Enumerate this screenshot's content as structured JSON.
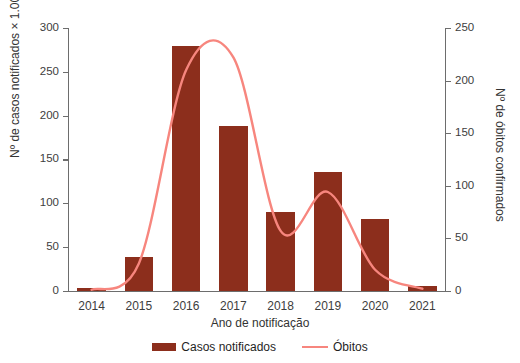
{
  "figure": {
    "cropped_title_fragment": "",
    "bar_color": "#8C2E1C",
    "line_color": "#F7867E",
    "axis_color": "#6D6D6D",
    "background": "#FFFFFF"
  },
  "chart_data": {
    "type": "bar",
    "title": "",
    "xlabel": "Ano de notificação",
    "ylabel": "Nº de casos notificados × 1.000",
    "ylabel_secondary": "Nº de óbitos confirmados",
    "categories": [
      "2014",
      "2015",
      "2016",
      "2017",
      "2018",
      "2019",
      "2020",
      "2021"
    ],
    "ylim": [
      0,
      300
    ],
    "yticks": [
      0,
      50,
      100,
      150,
      200,
      250,
      300
    ],
    "ytick_labels": [
      "0",
      "50",
      "100",
      "150",
      "200",
      "250",
      "300"
    ],
    "ylim_secondary": [
      0,
      250
    ],
    "yticks_secondary": [
      0,
      50,
      100,
      150,
      200,
      250
    ],
    "ytick_labels_secondary": [
      "0",
      "50",
      "100",
      "150",
      "200",
      "250"
    ],
    "grid": false,
    "legend_position": "bottom",
    "series": [
      {
        "name": "Casos notificados",
        "type": "bar",
        "axis": "left",
        "color": "#8C2E1C",
        "values": [
          3,
          39,
          280,
          188,
          90,
          136,
          82,
          5
        ]
      },
      {
        "name": "Óbitos",
        "type": "line",
        "axis": "right",
        "color": "#F7867E",
        "values": [
          1,
          26,
          210,
          222,
          57,
          94,
          20,
          2
        ]
      }
    ]
  },
  "legend": {
    "items": [
      {
        "label": "Casos notificados",
        "marker": "bar-swatch"
      },
      {
        "label": "Óbitos",
        "marker": "line-swatch"
      }
    ]
  }
}
